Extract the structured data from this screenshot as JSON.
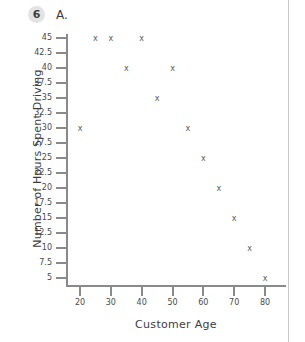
{
  "header": {
    "problem_number": "6",
    "part_label": "A."
  },
  "chart_data": {
    "type": "scatter",
    "title": "",
    "xlabel": "Customer Age",
    "ylabel": "Number of Hours Spent Driving",
    "xlim": [
      15,
      85
    ],
    "ylim": [
      2.5,
      45
    ],
    "grid": false,
    "legend": false,
    "marker": "x",
    "marker_color": "#5c5c5c",
    "x_ticks": [
      "20",
      "30",
      "40",
      "50",
      "60",
      "70",
      "80"
    ],
    "x_tick_values": [
      20,
      30,
      40,
      50,
      60,
      70,
      80
    ],
    "y_ticks": [
      "5",
      "7.5",
      "10",
      "12.5",
      "15",
      "17.5",
      "20",
      "22.5",
      "25",
      "27.5",
      "30",
      "32.5",
      "35",
      "37.5",
      "40",
      "42.5",
      "45"
    ],
    "y_tick_values": [
      5,
      7.5,
      10,
      12.5,
      15,
      17.5,
      20,
      22.5,
      25,
      27.5,
      30,
      32.5,
      35,
      37.5,
      40,
      42.5,
      45
    ],
    "points": [
      {
        "x": 20,
        "y": 30
      },
      {
        "x": 25,
        "y": 45
      },
      {
        "x": 30,
        "y": 45
      },
      {
        "x": 40,
        "y": 45
      },
      {
        "x": 35,
        "y": 40
      },
      {
        "x": 50,
        "y": 40
      },
      {
        "x": 45,
        "y": 35
      },
      {
        "x": 55,
        "y": 30
      },
      {
        "x": 60,
        "y": 25
      },
      {
        "x": 65,
        "y": 20
      },
      {
        "x": 70,
        "y": 15
      },
      {
        "x": 75,
        "y": 10
      },
      {
        "x": 80,
        "y": 5
      }
    ]
  }
}
